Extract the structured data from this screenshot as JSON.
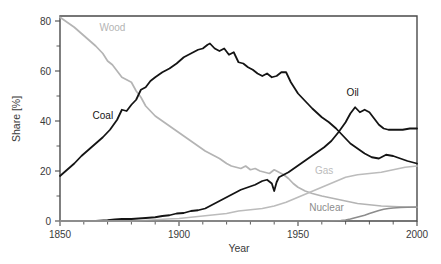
{
  "chart_data": {
    "type": "line",
    "title": "",
    "xlabel": "Year",
    "ylabel": "Share [%]",
    "xlim": [
      1850,
      2000
    ],
    "ylim": [
      0,
      82
    ],
    "grid": false,
    "legend_position": "inline-annotations",
    "x_ticks": [
      1850,
      1900,
      1950,
      2000
    ],
    "x_ticks_minor": [
      1860,
      1870,
      1880,
      1890,
      1910,
      1920,
      1930,
      1940,
      1960,
      1970,
      1980,
      1990
    ],
    "y_ticks": [
      0,
      20,
      40,
      60,
      80
    ],
    "y_ticks_minor": [
      10,
      30,
      50,
      70
    ],
    "x_tick_labels": [
      "1850",
      "1900",
      "1950",
      "2000"
    ],
    "y_tick_labels": [
      "0",
      "20",
      "40",
      "60",
      "80"
    ],
    "series": [
      {
        "name": "Wood",
        "color": "#b4b4b4",
        "label_x": 1872,
        "label_y": 76,
        "x": [
          1850,
          1853,
          1856,
          1859,
          1862,
          1865,
          1868,
          1870,
          1872,
          1874,
          1876,
          1878,
          1880,
          1882,
          1884,
          1886,
          1888,
          1890,
          1893,
          1896,
          1899,
          1902,
          1905,
          1908,
          1911,
          1914,
          1917,
          1920,
          1922,
          1924,
          1926,
          1928,
          1930,
          1932,
          1934,
          1936,
          1938,
          1940,
          1942,
          1944,
          1946,
          1948,
          1950,
          1953,
          1956,
          1960,
          1965,
          1970,
          1975,
          1980,
          1985,
          1990,
          1995,
          2000
        ],
        "y": [
          81.5,
          79.5,
          77.5,
          75.0,
          72.5,
          70.0,
          67.0,
          64.0,
          62.5,
          60.0,
          57.5,
          56.5,
          55.5,
          52.0,
          49.5,
          46.0,
          44.0,
          42.0,
          40.0,
          38.0,
          36.0,
          34.0,
          32.0,
          30.0,
          28.0,
          26.5,
          25.0,
          23.0,
          22.0,
          21.5,
          21.0,
          22.0,
          20.5,
          21.0,
          20.0,
          19.5,
          19.0,
          20.5,
          19.5,
          18.5,
          17.0,
          15.0,
          13.5,
          12.0,
          11.0,
          10.0,
          9.0,
          8.0,
          7.0,
          6.5,
          6.0,
          5.8,
          5.6,
          5.5
        ]
      },
      {
        "name": "Coal",
        "color": "#141414",
        "label_x": 1868,
        "label_y": 41,
        "x": [
          1850,
          1853,
          1856,
          1859,
          1862,
          1865,
          1868,
          1871,
          1874,
          1876,
          1878,
          1880,
          1882,
          1884,
          1886,
          1888,
          1890,
          1893,
          1896,
          1899,
          1902,
          1905,
          1908,
          1910,
          1912,
          1913,
          1915,
          1917,
          1919,
          1921,
          1923,
          1925,
          1927,
          1929,
          1931,
          1933,
          1935,
          1937,
          1939,
          1941,
          1943,
          1945,
          1947,
          1950,
          1953,
          1956,
          1960,
          1963,
          1966,
          1969,
          1972,
          1975,
          1978,
          1981,
          1984,
          1987,
          1990,
          1993,
          1996,
          2000
        ],
        "y": [
          18.0,
          20.5,
          23.0,
          26.0,
          28.5,
          31.0,
          33.5,
          36.5,
          40.5,
          44.5,
          44.0,
          46.5,
          48.5,
          52.5,
          53.5,
          56.0,
          57.5,
          59.5,
          61.0,
          63.0,
          65.5,
          67.0,
          68.5,
          69.0,
          70.5,
          71.0,
          69.0,
          68.0,
          69.0,
          66.5,
          67.5,
          63.5,
          63.0,
          61.5,
          60.5,
          59.0,
          58.0,
          59.0,
          57.5,
          58.0,
          59.5,
          59.5,
          55.5,
          51.0,
          48.0,
          45.0,
          41.5,
          39.5,
          37.0,
          34.0,
          31.0,
          29.0,
          27.0,
          25.5,
          25.0,
          26.5,
          26.0,
          25.0,
          24.0,
          23.0
        ]
      },
      {
        "name": "Oil",
        "color": "#141414",
        "label_x": 1973,
        "label_y": 50,
        "x": [
          1850,
          1865,
          1870,
          1873,
          1876,
          1880,
          1883,
          1886,
          1890,
          1893,
          1896,
          1899,
          1902,
          1905,
          1908,
          1911,
          1914,
          1917,
          1920,
          1923,
          1926,
          1929,
          1932,
          1935,
          1937,
          1939,
          1940,
          1941,
          1942,
          1944,
          1946,
          1949,
          1952,
          1955,
          1958,
          1961,
          1964,
          1967,
          1970,
          1972,
          1974,
          1976,
          1978,
          1980,
          1982,
          1984,
          1986,
          1988,
          1991,
          1994,
          1997,
          2000
        ],
        "y": [
          0.0,
          0.0,
          0.3,
          0.6,
          0.8,
          0.8,
          1.0,
          1.2,
          1.5,
          2.0,
          2.3,
          3.0,
          3.2,
          4.0,
          4.3,
          5.0,
          6.5,
          8.0,
          9.5,
          11.0,
          12.5,
          13.5,
          14.5,
          16.0,
          16.5,
          15.0,
          12.0,
          15.5,
          17.5,
          18.5,
          19.5,
          21.5,
          23.5,
          25.5,
          27.5,
          29.5,
          32.0,
          35.5,
          39.5,
          43.0,
          45.5,
          43.5,
          44.5,
          43.5,
          41.0,
          38.5,
          37.0,
          36.5,
          36.5,
          36.5,
          37.0,
          37.0
        ]
      },
      {
        "name": "Gas",
        "color": "#bcbcbc",
        "label_x": 1961,
        "label_y": 19,
        "x": [
          1850,
          1880,
          1885,
          1890,
          1895,
          1900,
          1905,
          1910,
          1915,
          1920,
          1925,
          1930,
          1935,
          1940,
          1945,
          1950,
          1955,
          1960,
          1965,
          1970,
          1975,
          1980,
          1985,
          1990,
          1995,
          2000
        ],
        "y": [
          0.0,
          0.0,
          0.2,
          0.5,
          0.8,
          1.0,
          1.5,
          2.0,
          2.5,
          3.0,
          4.0,
          4.5,
          5.0,
          6.0,
          7.5,
          9.5,
          11.5,
          13.5,
          15.5,
          17.5,
          18.5,
          19.0,
          19.5,
          20.5,
          21.5,
          22.0
        ]
      },
      {
        "name": "Nuclear",
        "color": "#8c8c8c",
        "label_x": 1962,
        "label_y": 4,
        "x": [
          1850,
          1960,
          1965,
          1968,
          1970,
          1972,
          1974,
          1976,
          1978,
          1980,
          1982,
          1984,
          1986,
          1988,
          1990,
          1993,
          1996,
          2000
        ],
        "y": [
          0.0,
          0.0,
          0.1,
          0.2,
          0.4,
          0.8,
          1.3,
          1.8,
          2.3,
          3.0,
          3.6,
          4.2,
          4.7,
          5.0,
          5.2,
          5.4,
          5.5,
          5.6
        ]
      }
    ]
  }
}
